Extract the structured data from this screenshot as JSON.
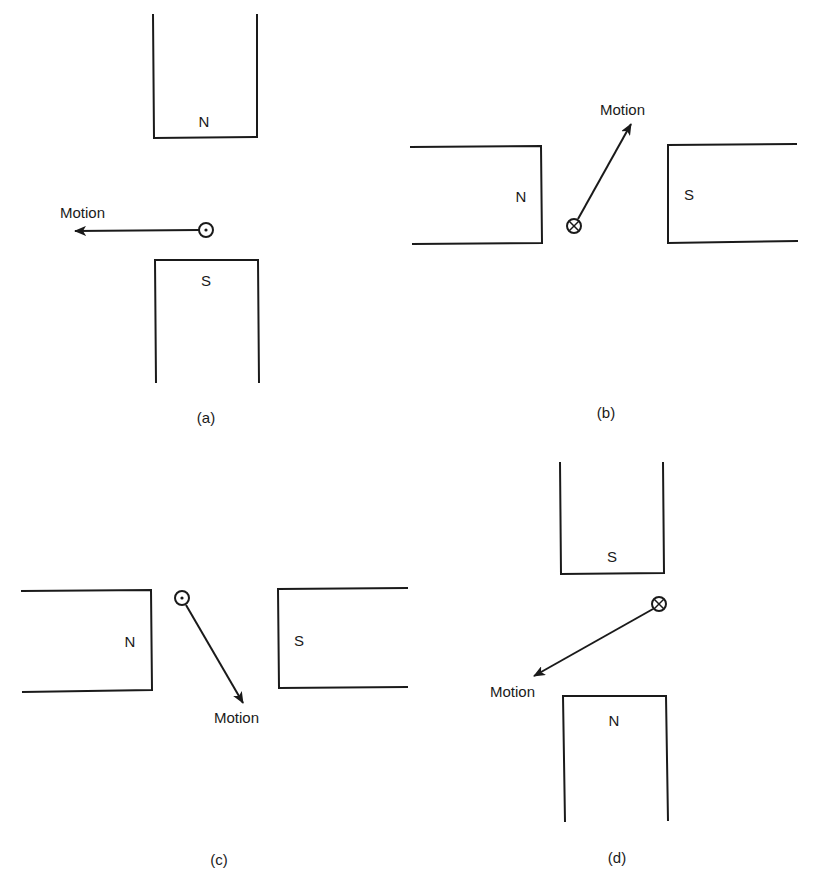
{
  "figure": {
    "panels": [
      {
        "id": "a",
        "caption": "(a)",
        "magnet_1_pole": "N",
        "magnet_2_pole": "S",
        "conductor_symbol": "dot (current out of page)",
        "motion_label": "Motion",
        "motion_direction": "left"
      },
      {
        "id": "b",
        "caption": "(b)",
        "magnet_1_pole": "N",
        "magnet_2_pole": "S",
        "conductor_symbol": "cross (current into page)",
        "motion_label": "Motion",
        "motion_direction": "up-right"
      },
      {
        "id": "c",
        "caption": "(c)",
        "magnet_1_pole": "N",
        "magnet_2_pole": "S",
        "conductor_symbol": "dot (current out of page)",
        "motion_label": "Motion",
        "motion_direction": "down-right"
      },
      {
        "id": "d",
        "caption": "(d)",
        "magnet_1_pole": "S",
        "magnet_2_pole": "N",
        "conductor_symbol": "cross (current into page)",
        "motion_label": "Motion",
        "motion_direction": "down-left"
      }
    ],
    "colors": {
      "ink": "#1a1a1a",
      "background": "#ffffff"
    }
  }
}
